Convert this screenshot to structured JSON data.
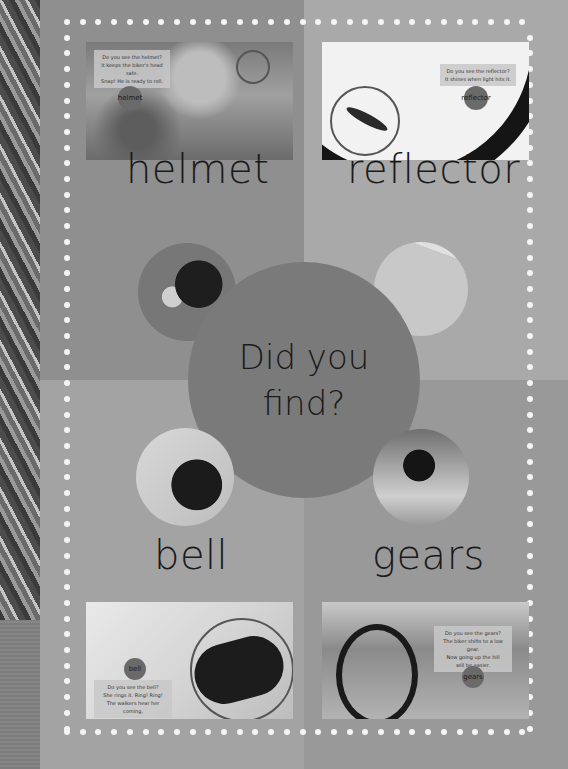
{
  "page": {
    "center": {
      "line1": "Did you",
      "line2": "find?"
    },
    "words": {
      "helmet": "helmet",
      "reflector": "reflector",
      "bell": "bell",
      "gears": "gears"
    },
    "photos": {
      "helmet": {
        "caption": [
          "Do you see the helmet?",
          "It keeps the biker's head safe.",
          "Snap! He is ready to roll."
        ],
        "tag": "helmet"
      },
      "reflector": {
        "caption": [
          "Do you see the reflector?",
          "It shines when light hits it."
        ],
        "tag": "reflector"
      },
      "bell": {
        "caption": [
          "Do you see the bell?",
          "She rings it. Ring! Ring!",
          "The walkers hear her coming."
        ],
        "tag": "bell"
      },
      "gears": {
        "caption": [
          "Do you see the gears?",
          "The biker shifts to a low gear.",
          "Now going up the hill",
          "will be easier."
        ],
        "tag": "gears"
      }
    },
    "colors": {
      "quad_top_left": "#8f8f8f",
      "quad_top_right": "#a9a9a9",
      "quad_bottom_left": "#a3a3a3",
      "quad_bottom_right": "#999999",
      "center_circle": "#7a7a7a",
      "dots": "#f4f4f4"
    }
  }
}
